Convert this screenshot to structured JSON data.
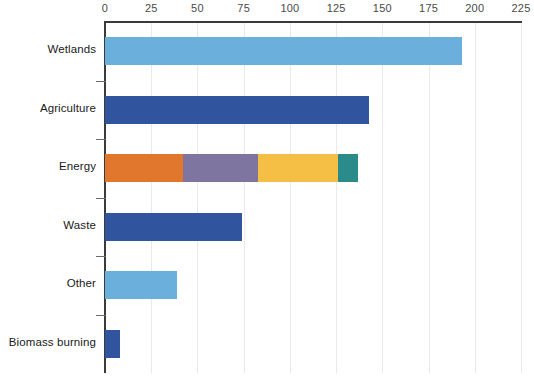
{
  "chart_data": {
    "type": "bar",
    "orientation": "horizontal",
    "title": "",
    "xlabel": "",
    "ylabel": "",
    "xlim": [
      0,
      225
    ],
    "xticks": [
      0,
      25,
      50,
      75,
      100,
      125,
      150,
      175,
      200,
      225
    ],
    "grid": true,
    "legend": "none",
    "axis_position": "top",
    "categories": [
      "Wetlands",
      "Agriculture",
      "Energy",
      "Waste",
      "Other",
      "Biomass burning"
    ],
    "values": [
      193,
      143,
      137,
      74,
      39,
      8
    ],
    "bars": [
      {
        "category": "Wetlands",
        "total": 193,
        "segments": [
          {
            "name": "wetlands",
            "value": 193,
            "color": "#6BAFDC"
          }
        ]
      },
      {
        "category": "Agriculture",
        "total": 143,
        "segments": [
          {
            "name": "agriculture",
            "value": 143,
            "color": "#31549F"
          }
        ]
      },
      {
        "category": "Energy",
        "total": 137,
        "segments": [
          {
            "name": "energy-segment-1",
            "value": 42,
            "color": "#E1762D"
          },
          {
            "name": "energy-segment-2",
            "value": 41,
            "color": "#7E76A0"
          },
          {
            "name": "energy-segment-3",
            "value": 43,
            "color": "#F5BE45"
          },
          {
            "name": "energy-segment-4",
            "value": 11,
            "color": "#2B8A8A"
          }
        ]
      },
      {
        "category": "Waste",
        "total": 74,
        "segments": [
          {
            "name": "waste",
            "value": 74,
            "color": "#31549F"
          }
        ]
      },
      {
        "category": "Other",
        "total": 39,
        "segments": [
          {
            "name": "other",
            "value": 39,
            "color": "#6BAFDC"
          }
        ]
      },
      {
        "category": "Biomass burning",
        "total": 8,
        "segments": [
          {
            "name": "biomass-burning",
            "value": 8,
            "color": "#31549F"
          }
        ]
      }
    ],
    "colors": {
      "light_blue": "#6BAFDC",
      "dark_blue": "#31549F",
      "orange": "#E1762D",
      "purple": "#7E76A0",
      "yellow": "#F5BE45",
      "teal": "#2B8A8A",
      "gridline": "#E9E9E9",
      "axis": "#3A3A3A",
      "tick_text": "#4A4A4A",
      "label_text": "#1A1A1A",
      "background": "#FFFFFF"
    }
  }
}
